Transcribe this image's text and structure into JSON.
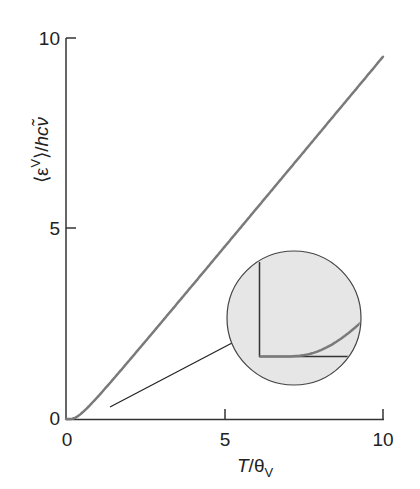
{
  "chart_data": {
    "type": "line",
    "title": "",
    "xlabel": "T/θV",
    "xlabel_main": "T/θ",
    "xlabel_sub": "V",
    "ylabel": "⟨εV⟩/hcν̃",
    "ylabel_main": "⟨ε",
    "ylabel_sup": "V",
    "ylabel_tail": "⟩/hcν̃",
    "xlim": [
      0,
      10
    ],
    "ylim": [
      0,
      10
    ],
    "x_ticks": [
      "0",
      "5",
      "10"
    ],
    "y_ticks": [
      "0",
      "5",
      "10"
    ],
    "grid": false,
    "legend": null,
    "series": [
      {
        "name": "mean vibrational energy",
        "x": [
          0,
          0.2,
          0.4,
          0.6,
          0.8,
          1.0,
          1.5,
          2,
          3,
          4,
          5,
          6,
          7,
          8,
          9,
          10
        ],
        "values": [
          0,
          0.007,
          0.089,
          0.234,
          0.398,
          0.582,
          1.054,
          1.541,
          2.528,
          3.521,
          4.517,
          5.514,
          6.512,
          7.51,
          8.509,
          9.508
        ]
      }
    ],
    "inset": {
      "shape": "circle",
      "description": "Magnified view of low-temperature region near origin showing curve rising from zero",
      "fill": "#e6e6e6"
    },
    "colors": {
      "curve": "#7a7a7a",
      "axes": "#333333",
      "inset_fill": "#e6e6e6"
    }
  }
}
